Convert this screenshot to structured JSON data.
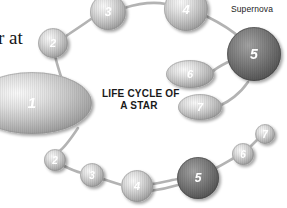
{
  "canvas": {
    "width": 287,
    "height": 208,
    "background": "#ffffff"
  },
  "title": {
    "line1": "LIFE CYCLE OF",
    "line2": "A STAR",
    "text": "LIFE CYCLE OF\nA STAR",
    "color": "#1a1a1a"
  },
  "labels": {
    "supernova": "Supernova",
    "page_text_fragment": "r at"
  },
  "colors": {
    "background": "#ffffff",
    "connector": "#b3b3b3",
    "sphere_light_core": "#f2f2f2",
    "sphere_light_mid": "#c9c9c9",
    "sphere_light_edge": "#9a9a9a",
    "sphere_dark_core": "#8d8d8d",
    "sphere_dark_mid": "#6e6e6e",
    "sphere_dark_edge": "#4e4e4e",
    "number_text": "#ffffff",
    "title_text": "#1a1a1a",
    "label_text": "#232323"
  },
  "diagram": {
    "type": "star-life-cycle-loop",
    "upper_track": {
      "name": "main-sequence-upper-path",
      "nodes": [
        {
          "id": "upper-1",
          "number": "1",
          "shape": "ellipse",
          "cx": 32,
          "cy": 103,
          "rx": 60,
          "ry": 31,
          "tone": "light",
          "font_size": 15
        },
        {
          "id": "upper-2",
          "number": "2",
          "shape": "circle",
          "cx": 53,
          "cy": 43,
          "rx": 15,
          "ry": 15,
          "tone": "light",
          "font_size": 11
        },
        {
          "id": "upper-3",
          "number": "3",
          "shape": "circle",
          "cx": 108,
          "cy": 12,
          "rx": 18,
          "ry": 18,
          "tone": "light",
          "font_size": 12
        },
        {
          "id": "upper-4",
          "number": "4",
          "shape": "circle",
          "cx": 186,
          "cy": 9,
          "rx": 22,
          "ry": 22,
          "tone": "light",
          "font_size": 13
        },
        {
          "id": "upper-5",
          "number": "5",
          "shape": "circle",
          "cx": 254,
          "cy": 54,
          "rx": 27,
          "ry": 27,
          "tone": "dark",
          "font_size": 14,
          "label": "Supernova"
        },
        {
          "id": "upper-6",
          "number": "6",
          "shape": "ellipse",
          "cx": 190,
          "cy": 74,
          "rx": 24,
          "ry": 14,
          "tone": "light",
          "font_size": 11
        },
        {
          "id": "upper-7",
          "number": "7",
          "shape": "ellipse",
          "cx": 200,
          "cy": 107,
          "rx": 22,
          "ry": 13,
          "tone": "light",
          "font_size": 11
        }
      ]
    },
    "lower_track": {
      "name": "main-sequence-lower-path",
      "nodes": [
        {
          "id": "lower-2",
          "number": "2",
          "shape": "circle",
          "cx": 55,
          "cy": 160,
          "rx": 11,
          "ry": 11,
          "tone": "light",
          "font_size": 10
        },
        {
          "id": "lower-3",
          "number": "3",
          "shape": "circle",
          "cx": 92,
          "cy": 175,
          "rx": 12,
          "ry": 12,
          "tone": "light",
          "font_size": 10
        },
        {
          "id": "lower-4",
          "number": "4",
          "shape": "circle",
          "cx": 137,
          "cy": 186,
          "rx": 16,
          "ry": 16,
          "tone": "light",
          "font_size": 11
        },
        {
          "id": "lower-5",
          "number": "5",
          "shape": "circle",
          "cx": 198,
          "cy": 178,
          "rx": 21,
          "ry": 21,
          "tone": "dark",
          "font_size": 12
        },
        {
          "id": "lower-6",
          "number": "6",
          "shape": "circle",
          "cx": 243,
          "cy": 154,
          "rx": 11,
          "ry": 11,
          "tone": "light",
          "font_size": 10
        },
        {
          "id": "lower-7",
          "number": "7",
          "shape": "circle",
          "cx": 265,
          "cy": 134,
          "rx": 10,
          "ry": 10,
          "tone": "light",
          "font_size": 10
        }
      ]
    },
    "connectors": [
      {
        "id": "c-u1-u2",
        "d": "M 66 92 C 60 74 56 62 55 55"
      },
      {
        "id": "c-u2-u3",
        "d": "M 66 36 C 78 28 90 20 94 17"
      },
      {
        "id": "c-u3-u4",
        "d": "M 124 8 C 140 3 156 2 166 4"
      },
      {
        "id": "c-u4-u5",
        "d": "M 206 16 C 222 24 234 32 240 38"
      },
      {
        "id": "c-u5-u6",
        "d": "M 228 62 C 220 66 214 70 212 72"
      },
      {
        "id": "c-u5-u7",
        "d": "M 248 82 C 240 94 228 102 221 105"
      },
      {
        "id": "c-l1-l2",
        "d": "M 78 128 C 70 140 62 150 58 152"
      },
      {
        "id": "c-l2-l3",
        "d": "M 64 166 C 72 170 78 172 82 173"
      },
      {
        "id": "c-l3-l4",
        "d": "M 103 179 C 112 182 118 184 122 185"
      },
      {
        "id": "c-l4-l5",
        "d": "M 152 184 C 164 182 172 180 178 179"
      },
      {
        "id": "c-l5-l6",
        "d": "M 216 168 C 224 164 230 160 234 158"
      },
      {
        "id": "c-l6-l7",
        "d": "M 251 146 C 255 142 258 139 259 138"
      },
      {
        "id": "c-l5-left",
        "d": "M 178 185 C 168 188 158 190 150 191"
      }
    ]
  }
}
